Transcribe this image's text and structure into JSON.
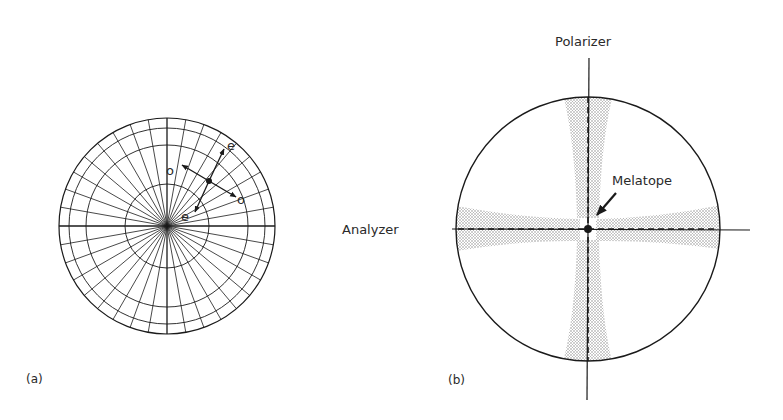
{
  "figure_a": {
    "panel_label": "(a)",
    "labels": {
      "o_upper": "o",
      "e_upper": "e",
      "o_lower": "o",
      "e_lower": "e"
    }
  },
  "figure_b": {
    "panel_label": "(b)",
    "labels": {
      "polarizer": "Polarizer",
      "analyzer": "Analyzer",
      "melatope": "Melatope"
    }
  },
  "colors": {
    "ink": "#1a1a1a",
    "stipple": "#bdbdbd"
  }
}
